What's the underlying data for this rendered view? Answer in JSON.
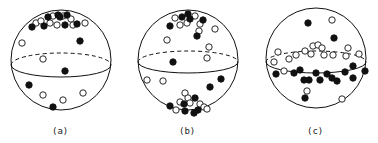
{
  "figure": {
    "panels": [
      {
        "id": "a",
        "label": "(a)",
        "center": [
          61,
          60
        ],
        "radius": 50,
        "equator": {
          "cy": 65,
          "ry": 12
        },
        "filled": [
          [
            32,
            27
          ],
          [
            44,
            26
          ],
          [
            48,
            17
          ],
          [
            58,
            15
          ],
          [
            60,
            17
          ],
          [
            67,
            15
          ],
          [
            65,
            25
          ],
          [
            77,
            24
          ],
          [
            80,
            41
          ],
          [
            65,
            71
          ],
          [
            29,
            85
          ],
          [
            53,
            107
          ]
        ],
        "open": [
          [
            36,
            23
          ],
          [
            41,
            21
          ],
          [
            50,
            23
          ],
          [
            53,
            16
          ],
          [
            57,
            25
          ],
          [
            63,
            16
          ],
          [
            71,
            19
          ],
          [
            73,
            25
          ],
          [
            85,
            23
          ],
          [
            22,
            43
          ],
          [
            43,
            59
          ],
          [
            43,
            95
          ],
          [
            63,
            100
          ],
          [
            83,
            93
          ]
        ]
      },
      {
        "id": "b",
        "label": "(b)",
        "center": [
          188,
          60
        ],
        "radius": 50,
        "equator": {
          "cy": 62,
          "ry": 11
        },
        "filled": [
          [
            170,
            26
          ],
          [
            182,
            17
          ],
          [
            188,
            14
          ],
          [
            190,
            19
          ],
          [
            203,
            20
          ],
          [
            197,
            36
          ],
          [
            173,
            62
          ],
          [
            221,
            79
          ],
          [
            210,
            87
          ],
          [
            170,
            106
          ],
          [
            184,
            104
          ],
          [
            185,
            111
          ],
          [
            195,
            98
          ],
          [
            198,
            110
          ],
          [
            194,
            113
          ]
        ],
        "open": [
          [
            175,
            18
          ],
          [
            180,
            25
          ],
          [
            187,
            23
          ],
          [
            195,
            16
          ],
          [
            200,
            24
          ],
          [
            199,
            31
          ],
          [
            215,
            29
          ],
          [
            167,
            40
          ],
          [
            209,
            47
          ],
          [
            207,
            58
          ],
          [
            147,
            80
          ],
          [
            163,
            81
          ],
          [
            185,
            93
          ],
          [
            188,
            98
          ],
          [
            180,
            102
          ],
          [
            190,
            103
          ],
          [
            176,
            110
          ],
          [
            200,
            104
          ],
          [
            204,
            107
          ],
          [
            207,
            109
          ]
        ]
      },
      {
        "id": "c",
        "label": "(c)",
        "center": [
          316,
          58
        ],
        "radius": 50,
        "equator": {
          "cy": 62,
          "ry": 11
        },
        "wave": true,
        "filled": [
          [
            308,
            23
          ],
          [
            334,
            38
          ],
          [
            276,
            74
          ],
          [
            294,
            73
          ],
          [
            300,
            70
          ],
          [
            309,
            80
          ],
          [
            316,
            73
          ],
          [
            304,
            80
          ],
          [
            320,
            80
          ],
          [
            327,
            74
          ],
          [
            332,
            78
          ],
          [
            337,
            81
          ],
          [
            345,
            72
          ],
          [
            353,
            66
          ],
          [
            353,
            78
          ],
          [
            365,
            71
          ],
          [
            305,
            98
          ]
        ],
        "open": [
          [
            332,
            20
          ],
          [
            278,
            52
          ],
          [
            274,
            62
          ],
          [
            289,
            59
          ],
          [
            296,
            55
          ],
          [
            305,
            51
          ],
          [
            313,
            46
          ],
          [
            318,
            45
          ],
          [
            311,
            54
          ],
          [
            322,
            48
          ],
          [
            324,
            55
          ],
          [
            333,
            55
          ],
          [
            348,
            48
          ],
          [
            346,
            56
          ],
          [
            359,
            54
          ],
          [
            284,
            71
          ],
          [
            307,
            91
          ],
          [
            342,
            99
          ]
        ]
      }
    ],
    "dot_radius": 3.2,
    "colors": {
      "stroke": "#111111",
      "fill_filled": "#111111",
      "fill_open": "#ffffff"
    }
  }
}
